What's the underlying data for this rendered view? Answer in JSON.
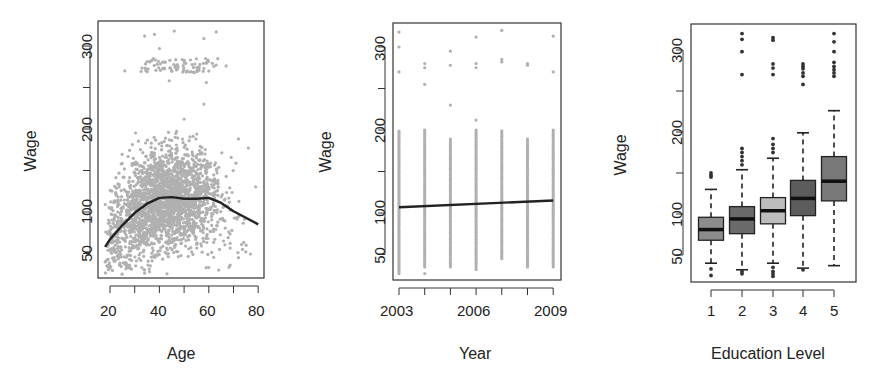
{
  "chart_data": [
    {
      "type": "scatter",
      "title": "",
      "xlabel": "Age",
      "ylabel": "Wage",
      "xlim": [
        17,
        82
      ],
      "ylim": [
        20,
        330
      ],
      "x_ticks": [
        20,
        30,
        40,
        50,
        60,
        70,
        80
      ],
      "x_tick_labels": [
        "20",
        "40",
        "60",
        "80"
      ],
      "y_ticks": [
        50,
        100,
        150,
        200,
        250,
        300
      ],
      "y_tick_labels": [
        "50",
        "100",
        "200",
        "300"
      ],
      "grid": false,
      "point_color": "#b0b0b0",
      "scatter_summary": "Dense cloud of ~3000 points, mostly 40–200, a separate band near 270–285 for ages ~30–65, sparse outliers up to ~320",
      "smooth_fit": {
        "color": "#222222",
        "x": [
          18,
          20,
          25,
          30,
          35,
          40,
          45,
          50,
          55,
          60,
          65,
          70,
          75,
          80
        ],
        "y": [
          58,
          67,
          84,
          99,
          110,
          117,
          118,
          116,
          116,
          117,
          111,
          101,
          93,
          85
        ]
      }
    },
    {
      "type": "scatter",
      "title": "",
      "xlabel": "Year",
      "ylabel": "Wage",
      "xlim": [
        2002.8,
        2009.3
      ],
      "ylim": [
        20,
        330
      ],
      "x_ticks": [
        2003,
        2004,
        2005,
        2006,
        2007,
        2008,
        2009
      ],
      "x_tick_labels": [
        "2003",
        "2006",
        "2009"
      ],
      "y_ticks": [
        50,
        100,
        150,
        200,
        250,
        300
      ],
      "y_tick_labels": [
        "50",
        "100",
        "200",
        "300"
      ],
      "grid": false,
      "point_color": "#b0b0b0",
      "scatter_summary": "Vertical strips at each year spanning ~25–200 with sparse outliers between 230 and 320",
      "outliers": {
        "2003": [
          318,
          300,
          270
        ],
        "2004": [
          280,
          275,
          255
        ],
        "2005": [
          295,
          278,
          230
        ],
        "2006": [
          312,
          280,
          275,
          212
        ],
        "2007": [
          320,
          285,
          282
        ],
        "2008": [
          280,
          278
        ],
        "2009": [
          313,
          270
        ]
      },
      "linear_fit": {
        "color": "#222222",
        "x": [
          2003,
          2009
        ],
        "y": [
          107,
          115
        ]
      }
    },
    {
      "type": "box",
      "title": "",
      "xlabel": "Education Level",
      "ylabel": "Wage",
      "categories": [
        "1",
        "2",
        "3",
        "4",
        "5"
      ],
      "ylim": [
        20,
        330
      ],
      "y_ticks": [
        50,
        100,
        150,
        200,
        250,
        300
      ],
      "y_tick_labels": [
        "50",
        "100",
        "200",
        "300"
      ],
      "grid": false,
      "boxes": [
        {
          "label": "1",
          "whisker_low": 40,
          "q1": 68,
          "median": 81,
          "q3": 96,
          "whisker_high": 130,
          "fill": "#8c8c8c",
          "outliers_high": [
            150,
            147,
            145
          ],
          "outliers_low": [
            33,
            25
          ]
        },
        {
          "label": "2",
          "whisker_low": 32,
          "q1": 76,
          "median": 94,
          "q3": 109,
          "whisker_high": 154,
          "fill": "#6a6a6a",
          "outliers_high": [
            320,
            313,
            298,
            270,
            180,
            175,
            170,
            165,
            160
          ],
          "outliers_low": [
            30,
            27
          ]
        },
        {
          "label": "3",
          "whisker_low": 40,
          "q1": 88,
          "median": 104,
          "q3": 120,
          "whisker_high": 168,
          "fill": "#bdbdbd",
          "outliers_high": [
            315,
            312,
            283,
            278,
            270,
            192,
            185,
            180,
            175
          ],
          "outliers_low": [
            35,
            30,
            27,
            24
          ]
        },
        {
          "label": "4",
          "whisker_low": 34,
          "q1": 98,
          "median": 119,
          "q3": 141,
          "whisker_high": 199,
          "fill": "#5c5c5c",
          "outliers_high": [
            283,
            280,
            277,
            272,
            268,
            258
          ],
          "outliers_low": [
            32
          ]
        },
        {
          "label": "5",
          "whisker_low": 37,
          "q1": 116,
          "median": 140,
          "q3": 170,
          "whisker_high": 226,
          "fill": "#787878",
          "outliers_high": [
            320,
            310,
            298,
            285,
            280,
            276,
            272,
            268
          ],
          "outliers_low": []
        }
      ]
    }
  ],
  "panels": [
    {
      "xlabel": "Age",
      "ylabel": "Wage",
      "xticks": [
        "20",
        "40",
        "60",
        "80"
      ],
      "yticks": [
        "50",
        "100",
        "200",
        "300"
      ]
    },
    {
      "xlabel": "Year",
      "ylabel": "Wage",
      "xticks": [
        "2003",
        "2006",
        "2009"
      ],
      "yticks": [
        "50",
        "100",
        "200",
        "300"
      ]
    },
    {
      "xlabel": "Education Level",
      "ylabel": "Wage",
      "xticks": [
        "1",
        "2",
        "3",
        "4",
        "5"
      ],
      "yticks": [
        "50",
        "100",
        "200",
        "300"
      ]
    }
  ]
}
